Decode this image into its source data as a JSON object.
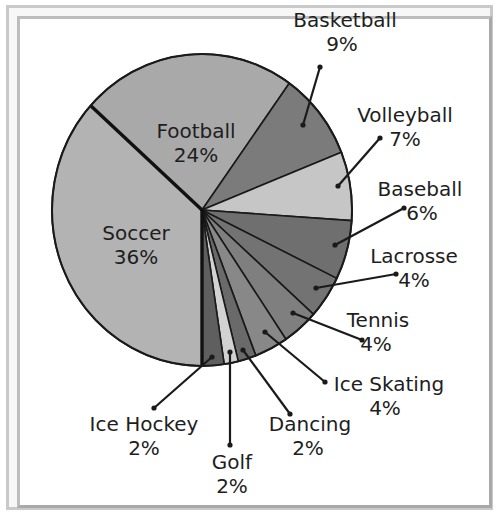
{
  "chart_data": {
    "type": "pie",
    "title": "",
    "center": [
      202,
      210
    ],
    "radius": [
      150,
      156
    ],
    "slices": [
      {
        "name": "Soccer",
        "value": 36,
        "label": "Soccer",
        "pct": "36%",
        "color": "#b3b3b3",
        "start": 138,
        "end": 270,
        "label_pos": [
          136,
          232
        ],
        "inside": true
      },
      {
        "name": "Football",
        "value": 24,
        "label": "Football",
        "pct": "24%",
        "color": "#a9a9a9",
        "start": 54.4,
        "end": 138,
        "label_pos": [
          196,
          130
        ],
        "inside": true
      },
      {
        "name": "Basketball",
        "value": 9,
        "label": "Basketball",
        "pct": "9%",
        "color": "#7b7b7b",
        "start": 21.7,
        "end": 54.4,
        "label_pos": [
          345,
          27
        ],
        "leader": [
          [
            303,
            125
          ],
          [
            320,
            67
          ]
        ]
      },
      {
        "name": "Volleyball",
        "value": 7,
        "label": "Volleyball",
        "pct": "7%",
        "color": "#c6c6c6",
        "start": -3.9,
        "end": 21.7,
        "label_pos": [
          405,
          122
        ],
        "leader": [
          [
            338,
            186
          ],
          [
            380,
            138
          ]
        ]
      },
      {
        "name": "Baseball",
        "value": 6,
        "label": "Baseball",
        "pct": "6%",
        "color": "#6f6f6f",
        "start": -26,
        "end": -3.9,
        "label_pos": [
          418,
          196
        ],
        "leader": [
          [
            335,
            245
          ],
          [
            404,
            208
          ]
        ]
      },
      {
        "name": "Lacrosse",
        "value": 4,
        "label": "Lacrosse",
        "pct": "4%",
        "color": "#737373",
        "start": -42,
        "end": -26,
        "label_pos": [
          414,
          263
        ],
        "leader": [
          [
            316,
            288
          ],
          [
            396,
            274
          ]
        ]
      },
      {
        "name": "Tennis",
        "value": 4,
        "label": "Tennis",
        "pct": "4%",
        "color": "#7f7f7f",
        "start": -56,
        "end": -42,
        "label_pos": [
          378,
          327
        ],
        "leader": [
          [
            293,
            313
          ],
          [
            362,
            340
          ]
        ]
      },
      {
        "name": "Ice Skating",
        "value": 4,
        "label": "Ice Skating",
        "pct": "4%",
        "color": "#888888",
        "start": -69,
        "end": -56,
        "label_pos": [
          389,
          391
        ],
        "leader": [
          [
            265,
            332
          ],
          [
            325,
            382
          ]
        ]
      },
      {
        "name": "Dancing",
        "value": 2,
        "label": "Dancing",
        "pct": "2%",
        "color": "#6a6a6a",
        "start": -76,
        "end": -69,
        "label_pos": [
          310,
          431
        ],
        "leader": [
          [
            243,
            350
          ],
          [
            290,
            414
          ]
        ]
      },
      {
        "name": "Golf",
        "value": 2,
        "label": "Golf",
        "pct": "2%",
        "color": "#d2d2d2",
        "start": -81.5,
        "end": -76,
        "label_pos": [
          232,
          469
        ],
        "leader": [
          [
            230,
            352
          ],
          [
            230,
            445
          ]
        ]
      },
      {
        "name": "Ice Hockey",
        "value": 2,
        "label": "Ice Hockey",
        "pct": "2%",
        "color": "#5f5f5f",
        "start": -90,
        "end": -81.5,
        "label_pos": [
          144,
          431
        ],
        "leader": [
          [
            212,
            357
          ],
          [
            154,
            408
          ]
        ]
      }
    ],
    "legend": "none"
  },
  "labels": {
    "soccer": "Soccer",
    "soccer_pct": "36%",
    "football": "Football",
    "football_pct": "24%",
    "basketball": "Basketball",
    "basketball_pct": "9%",
    "volleyball": "Volleyball",
    "volleyball_pct": "7%",
    "baseball": "Baseball",
    "baseball_pct": "6%",
    "lacrosse": "Lacrosse",
    "lacrosse_pct": "4%",
    "tennis": "Tennis",
    "tennis_pct": "4%",
    "ice_skating": "Ice Skating",
    "ice_skating_pct": "4%",
    "dancing": "Dancing",
    "dancing_pct": "2%",
    "golf": "Golf",
    "golf_pct": "2%",
    "ice_hockey": "Ice Hockey",
    "ice_hockey_pct": "2%"
  }
}
